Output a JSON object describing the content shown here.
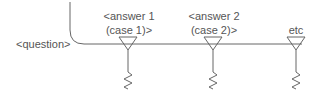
{
  "diagram": {
    "question_label": "<question>",
    "branches": [
      {
        "line1": "<answer 1",
        "line2": "(case 1)>"
      },
      {
        "line1": "<answer 2",
        "line2": "(case 2)>"
      },
      {
        "line1": "etc",
        "line2": ""
      }
    ],
    "stroke_color": "#666666",
    "text_color": "#555555"
  }
}
